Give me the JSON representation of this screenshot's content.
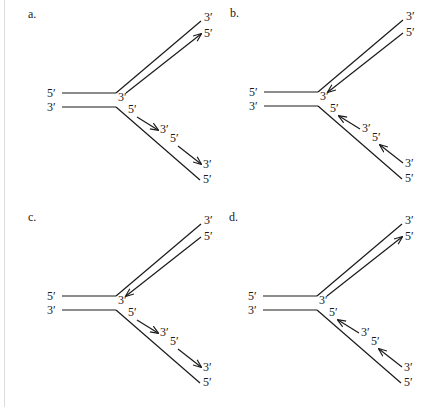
{
  "figure": {
    "title": "",
    "colors": {
      "ink": "#1a1a1a",
      "background": "#ffffff",
      "rule": "#dcdcdc"
    }
  },
  "panels": [
    {
      "id": "a",
      "label": "a.",
      "parent_labels": {
        "top": "5′",
        "bottom": "3′"
      },
      "upper_arm": {
        "outer_end_label": "3′",
        "inner_end_label": "5′",
        "inner_fork_label": "3′",
        "arrow_direction": "away-from-fork"
      },
      "lower_arm": {
        "fragment1_start": "5′",
        "fragment1_end": "3′",
        "fragment2_start": "5′",
        "fragment2_end": "3′",
        "outer_end_label": "5′",
        "arrow_direction": "away-from-fork"
      }
    },
    {
      "id": "b",
      "label": "b.",
      "parent_labels": {
        "top": "5′",
        "bottom": "3′"
      },
      "upper_arm": {
        "outer_end_label": "3′",
        "inner_end_label": "5′",
        "inner_fork_label": "3′",
        "arrow_direction": "toward-fork"
      },
      "lower_arm": {
        "fragment1_start": "5′",
        "fragment1_end": "3′",
        "fragment2_start": "5′",
        "fragment2_end": "3′",
        "outer_end_label": "5′",
        "arrow_direction": "toward-fork"
      }
    },
    {
      "id": "c",
      "label": "c.",
      "parent_labels": {
        "top": "5′",
        "bottom": "3′"
      },
      "upper_arm": {
        "outer_end_label": "3′",
        "inner_end_label": "5′",
        "inner_fork_label": "3′",
        "arrow_direction": "toward-fork"
      },
      "lower_arm": {
        "fragment1_start": "5′",
        "fragment1_end": "3′",
        "fragment2_start": "5′",
        "fragment2_end": "3′",
        "outer_end_label": "5′",
        "arrow_direction": "away-from-fork"
      }
    },
    {
      "id": "d",
      "label": "d.",
      "parent_labels": {
        "top": "5′",
        "bottom": "3′"
      },
      "upper_arm": {
        "outer_end_label": "3′",
        "inner_end_label": "5′",
        "inner_fork_label": "3′",
        "arrow_direction": "away-from-fork"
      },
      "lower_arm": {
        "fragment1_start": "5′",
        "fragment1_end": "3′",
        "fragment2_start": "5′",
        "fragment2_end": "3′",
        "outer_end_label": "5′",
        "arrow_direction": "toward-fork"
      }
    }
  ]
}
